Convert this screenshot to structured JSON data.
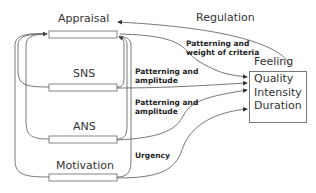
{
  "nodes": {
    "appraisal": "Appraisal",
    "sns": "SNS",
    "ans": "ANS",
    "motivation": "Motivation",
    "feeling": "Feeling"
  },
  "feeling_box": {
    "lines": [
      "Quality",
      "Intensity",
      "Duration"
    ]
  },
  "edges": {
    "regulation": "Regulation",
    "appraisal_to_box": [
      "Patterning and",
      "weight of criteria"
    ],
    "sns_to_box": [
      "Patterning and",
      "amplitude"
    ],
    "ans_to_box": [
      "Patterning and",
      "amplitude"
    ],
    "motivation_to_box": "Urgency"
  },
  "colors": {
    "line": "#444444",
    "text": "#333333",
    "bar_border": "#666666"
  }
}
